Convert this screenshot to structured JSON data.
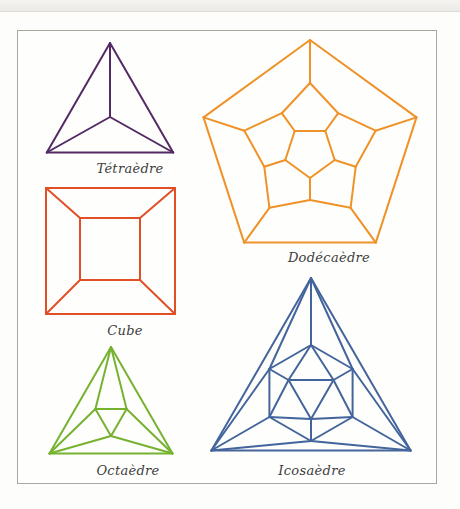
{
  "page": {
    "background": "#fdfdfb",
    "frame_color": "#aba79f",
    "label_color": "#3d3c3c"
  },
  "figures": [
    {
      "id": "tetrahedron",
      "label": "Tétraèdre",
      "color": "#542a64",
      "type": "tetra",
      "center": [
        110,
        116
      ],
      "outer_r": 73,
      "hub": [
        110,
        117
      ],
      "label_pos": [
        130,
        168
      ]
    },
    {
      "id": "cube",
      "label": "Cube",
      "color": "#e14f27",
      "type": "cube",
      "outer_rect": [
        46,
        188,
        175,
        314
      ],
      "inner_rect": [
        80,
        218,
        140,
        280
      ],
      "label_pos": [
        125,
        330
      ]
    },
    {
      "id": "dodecahedron",
      "label": "Dodécaèdre",
      "color": "#ef9227",
      "type": "dodeca",
      "center": [
        310,
        152
      ],
      "outer_r": 112,
      "a_r": 69,
      "b_r": 48,
      "inner_r": 26,
      "label_pos": [
        329,
        257
      ]
    },
    {
      "id": "octahedron",
      "label": "Octaèdre",
      "color": "#76b22f",
      "type": "octa",
      "center": [
        111,
        418
      ],
      "outer_r": 71,
      "inner_r": 18,
      "label_pos": [
        128,
        470
      ]
    },
    {
      "id": "icosahedron",
      "label": "Icosaèdre",
      "color": "#44659c",
      "type": "icosa",
      "center": [
        311,
        393
      ],
      "outer_r": 115,
      "ring_r": 48,
      "inner_r": 26,
      "label_pos": [
        312,
        470
      ]
    }
  ]
}
